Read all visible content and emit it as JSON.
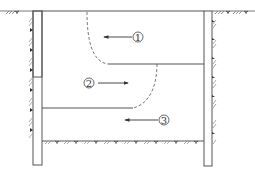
{
  "diagram": {
    "type": "excavation-cross-section",
    "walls": [
      "left-retaining-wall",
      "right-retaining-wall"
    ],
    "layers": [
      {
        "id": 1,
        "label": "①",
        "direction": "left"
      },
      {
        "id": 2,
        "label": "②",
        "direction": "right"
      },
      {
        "id": 3,
        "label": "③",
        "direction": "left"
      }
    ],
    "colors": {
      "line": "#555555",
      "hatch": "#777777",
      "background": "#ffffff"
    }
  }
}
